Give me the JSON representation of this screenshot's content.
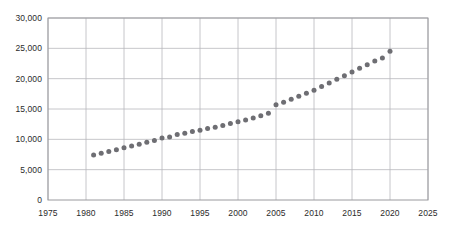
{
  "chart_data": {
    "type": "scatter",
    "title": "",
    "xlabel": "",
    "ylabel": "",
    "grid": true,
    "legend": null,
    "marker": {
      "shape": "circle",
      "color": "#6e6e73",
      "size_px": 5
    },
    "xlim": [
      1975,
      2025
    ],
    "ylim": [
      0,
      30000
    ],
    "xticks": [
      1975,
      1980,
      1985,
      1990,
      1995,
      2000,
      2005,
      2010,
      2015,
      2020,
      2025
    ],
    "xticklabels": [
      "1975",
      "1980",
      "1985",
      "1990",
      "1995",
      "2000",
      "2005",
      "2010",
      "2015",
      "2020",
      "2025"
    ],
    "yticks": [
      0,
      5000,
      10000,
      15000,
      20000,
      25000,
      30000
    ],
    "yticklabels": [
      "0",
      "5,000",
      "10,000",
      "15,000",
      "20,000",
      "25,000",
      "30,000"
    ],
    "x": [
      1981,
      1982,
      1983,
      1984,
      1985,
      1986,
      1987,
      1988,
      1989,
      1990,
      1991,
      1992,
      1993,
      1994,
      1995,
      1996,
      1997,
      1998,
      1999,
      2000,
      2001,
      2002,
      2003,
      2004,
      2005,
      2006,
      2007,
      2008,
      2009,
      2010,
      2011,
      2012,
      2013,
      2014,
      2015,
      2016,
      2017,
      2018,
      2019,
      2020
    ],
    "values": [
      7400,
      7700,
      8000,
      8300,
      8600,
      8900,
      9200,
      9500,
      9800,
      10200,
      10400,
      10800,
      11000,
      11300,
      11500,
      11800,
      12000,
      12300,
      12600,
      12900,
      13200,
      13500,
      13900,
      14300,
      15700,
      16100,
      16600,
      17100,
      17600,
      18100,
      18700,
      19300,
      19900,
      20500,
      21100,
      21700,
      22300,
      22900,
      23400,
      24500
    ]
  },
  "axis": {
    "x_title": "",
    "y_title": ""
  }
}
